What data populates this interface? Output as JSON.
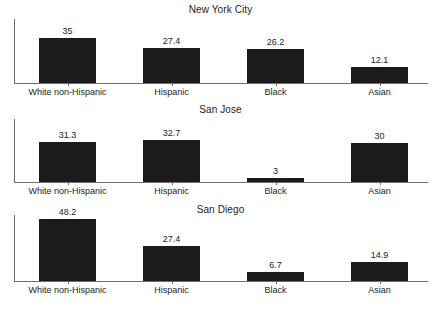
{
  "figure": {
    "background": "#ffffff",
    "bar_color": "#1b1b1b",
    "axis_color": "#6d6d6d",
    "text_color": "#222222"
  },
  "chart_data": [
    {
      "type": "bar",
      "title": "New York City",
      "categories": [
        "White non-Hispanic",
        "Hispanic",
        "Black",
        "Asian"
      ],
      "values": [
        35,
        27.4,
        26.2,
        12.1
      ],
      "value_labels": [
        "35",
        "27.4",
        "26.2",
        "12.1"
      ],
      "xlabel": "",
      "ylabel": "",
      "ylim": [
        0,
        50
      ],
      "grid": false,
      "legend": "none"
    },
    {
      "type": "bar",
      "title": "San Jose",
      "categories": [
        "White non-Hispanic",
        "Hispanic",
        "Black",
        "Asian"
      ],
      "values": [
        31.3,
        32.7,
        3,
        30
      ],
      "value_labels": [
        "31.3",
        "32.7",
        "3",
        "30"
      ],
      "xlabel": "",
      "ylabel": "",
      "ylim": [
        0,
        50
      ],
      "grid": false,
      "legend": "none"
    },
    {
      "type": "bar",
      "title": "San Diego",
      "categories": [
        "White non-Hispanic",
        "Hispanic",
        "Black",
        "Asian"
      ],
      "values": [
        48.2,
        27.4,
        6.7,
        14.9
      ],
      "value_labels": [
        "48.2",
        "27.4",
        "6.7",
        "14.9"
      ],
      "xlabel": "",
      "ylabel": "",
      "ylim": [
        0,
        50
      ],
      "grid": false,
      "legend": "none"
    }
  ]
}
